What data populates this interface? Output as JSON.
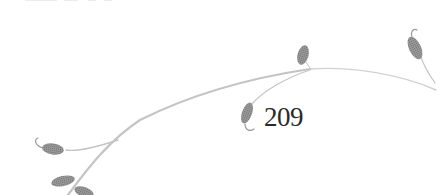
{
  "page": {
    "number": "209"
  },
  "decoration": {
    "type": "vine-with-leaves",
    "icon": "vine-ornament-icon",
    "colors": {
      "stem": "#c8c8c8",
      "leaf": "#8a8a8a",
      "text": "#2a2a2a",
      "background": "#ffffff"
    }
  }
}
